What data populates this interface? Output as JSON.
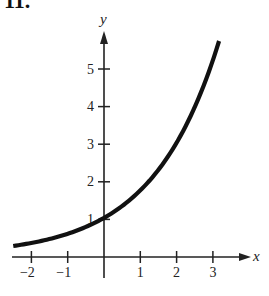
{
  "problem_number": "11.",
  "chart_data": {
    "type": "line",
    "title": "",
    "xlabel": "x",
    "ylabel": "y",
    "function": "y = 3^(x/2)",
    "xlim": [
      -2.5,
      3.17
    ],
    "ylim": [
      0,
      5.7
    ],
    "x_ticks": [
      -2,
      -1,
      1,
      2,
      3
    ],
    "x_tick_labels": [
      "−2",
      "−1",
      "1",
      "2",
      "3"
    ],
    "y_ticks": [
      1,
      2,
      3,
      4,
      5
    ],
    "y_tick_labels": [
      "1",
      "2",
      "3",
      "4",
      "5"
    ],
    "grid": false,
    "legend": null,
    "series": [
      {
        "name": "curve",
        "x": [
          -2.48,
          -2,
          -1.5,
          -1,
          -0.5,
          0,
          0.5,
          1,
          1.5,
          2,
          2.5,
          3,
          3.17
        ],
        "y": [
          0.26,
          0.33,
          0.44,
          0.58,
          0.76,
          1.0,
          1.32,
          1.73,
          2.28,
          3.0,
          3.95,
          5.2,
          5.7
        ]
      }
    ],
    "annotations": [
      "curve passes through (0, 1)"
    ]
  }
}
